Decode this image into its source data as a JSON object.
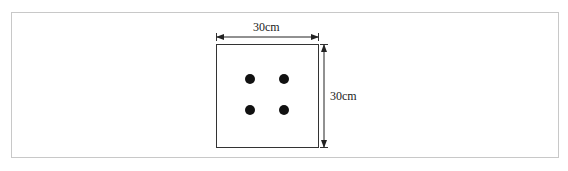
{
  "diagram": {
    "type": "square-cross-section",
    "width_label": "30cm",
    "height_label": "30cm",
    "square": {
      "x": 216,
      "y": 44,
      "width": 102,
      "height": 103
    },
    "dots": [
      {
        "cx": 250,
        "cy": 79
      },
      {
        "cx": 284,
        "cy": 79
      },
      {
        "cx": 250,
        "cy": 110
      },
      {
        "cx": 284,
        "cy": 110
      }
    ],
    "dot_radius": 5,
    "colors": {
      "stroke": "#333333",
      "dot": "#111111",
      "frame": "#c8c8c8"
    }
  }
}
